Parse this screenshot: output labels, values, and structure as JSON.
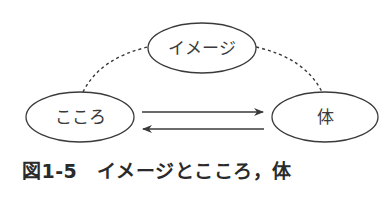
{
  "diagram": {
    "nodes": [
      {
        "id": "image",
        "label": "イメージ",
        "cx": 202,
        "cy": 48,
        "rx": 54,
        "ry": 25
      },
      {
        "id": "kokoro",
        "label": "こころ",
        "cx": 80,
        "cy": 117,
        "rx": 54,
        "ry": 25
      },
      {
        "id": "body",
        "label": "体",
        "cx": 325,
        "cy": 117,
        "rx": 53,
        "ry": 25
      }
    ],
    "edges": [
      {
        "from": "kokoro",
        "to": "body",
        "style": "solid",
        "direction": "right"
      },
      {
        "from": "body",
        "to": "kokoro",
        "style": "solid",
        "direction": "left"
      },
      {
        "from": "kokoro",
        "to": "image",
        "style": "dashed"
      },
      {
        "from": "image",
        "to": "body",
        "style": "dashed"
      }
    ],
    "colors": {
      "stroke": "#3a3a3a",
      "text": "#3a3a3a",
      "background": "#ffffff"
    }
  },
  "caption": {
    "text": "図1-5　イメージとこころ，体"
  }
}
